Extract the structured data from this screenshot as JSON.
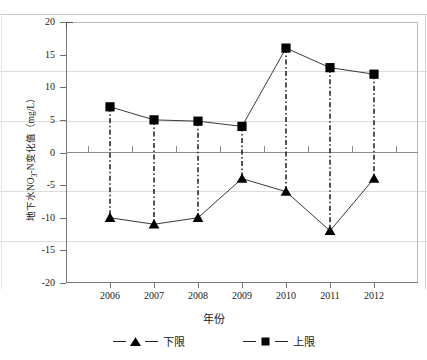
{
  "chart_data": {
    "type": "line",
    "title": "",
    "xlabel": "年份",
    "ylabel": "地下水NO3-N变化值（mg/L）",
    "ylabel_main": "地下水NO",
    "ylabel_sub": "3",
    "ylabel_tail": "-N变化值（mg/L）",
    "categories": [
      "2006",
      "2007",
      "2008",
      "2009",
      "2010",
      "2011",
      "2012"
    ],
    "x": [
      2006,
      2007,
      2008,
      2009,
      2010,
      2011,
      2012
    ],
    "ylim": [
      -20,
      20
    ],
    "yticks": [
      "20",
      "15",
      "10",
      "5",
      "0",
      "-5",
      "-10",
      "-15",
      "-20"
    ],
    "ytick_values": [
      20,
      15,
      10,
      5,
      0,
      -5,
      -10,
      -15,
      -20
    ],
    "grid": false,
    "legend_position": "bottom",
    "series": [
      {
        "name": "上限",
        "marker": "square",
        "values": [
          7,
          5,
          4.8,
          4,
          16,
          13,
          12
        ]
      },
      {
        "name": "下限",
        "marker": "triangle",
        "values": [
          -10,
          -11,
          -10,
          -4,
          -6,
          -12,
          -4
        ]
      }
    ],
    "connector_style": "dash-dot-vertical"
  },
  "axes": {
    "y_title": "地下水NO3-N变化值（mg/L）",
    "x_title": "年份"
  },
  "legend": {
    "items": [
      {
        "label": "下限",
        "marker": "triangle-marker"
      },
      {
        "label": "上限",
        "marker": "square-marker"
      }
    ]
  }
}
